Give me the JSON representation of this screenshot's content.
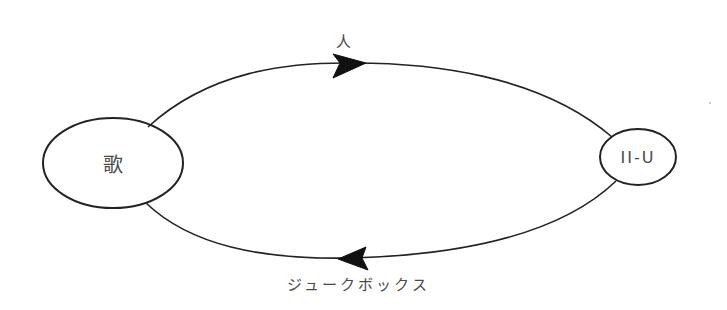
{
  "diagram": {
    "nodes": [
      {
        "id": "left",
        "label": "歌"
      },
      {
        "id": "right",
        "label": "II-U"
      }
    ],
    "edges": [
      {
        "from": "left",
        "to": "right",
        "label": "人",
        "direction": "right"
      },
      {
        "from": "right",
        "to": "left",
        "label": "ジュークボックス",
        "direction": "left"
      }
    ],
    "colors": {
      "stroke": "#222222",
      "text": "#4a4a4a",
      "background": "#ffffff"
    }
  }
}
